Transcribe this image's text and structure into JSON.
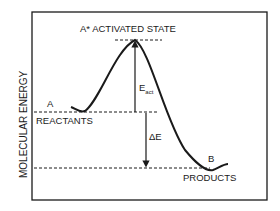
{
  "diagram": {
    "type": "energy-profile",
    "ylabel": "MOLECULAR ENERGY",
    "peak_label": "A* ACTIVATED STATE",
    "reactant_letter": "A",
    "reactant_label": "REACTANTS",
    "product_letter": "B",
    "product_label": "PRODUCTS",
    "eact_main": "E",
    "eact_sub": "act",
    "delta_e": "ΔE",
    "colors": {
      "line": "#1a1a1a",
      "background": "#ffffff"
    }
  }
}
